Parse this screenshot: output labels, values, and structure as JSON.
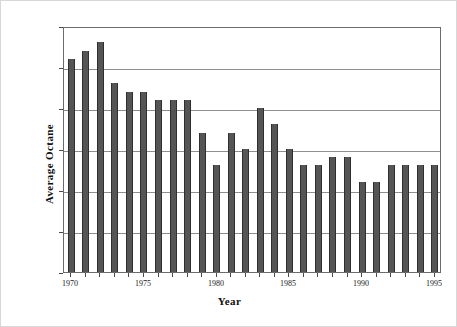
{
  "chart_data": {
    "type": "bar",
    "title": "",
    "xlabel": "Year",
    "ylabel": "Average Octane",
    "ylim": [
      87.5,
      90.5
    ],
    "ytick_labels": [
      "87.5",
      "88.0",
      "88.5",
      "89.0",
      "89.5",
      "90.0",
      "90.5"
    ],
    "ytick_values": [
      87.5,
      88.0,
      88.5,
      89.0,
      89.5,
      90.0,
      90.5
    ],
    "xtick_labels": [
      "1970",
      "1975",
      "1980",
      "1985",
      "1990",
      "1995"
    ],
    "xtick_values": [
      1970,
      1975,
      1980,
      1985,
      1990,
      1995
    ],
    "grid": "horizontal",
    "legend": "none",
    "bar_color": "#555555",
    "bar_edge_color": "#2f2f2f",
    "gridline_color": "#8f8f8f",
    "frame_color": "#6b6b6b",
    "categories": [
      1970,
      1971,
      1972,
      1973,
      1974,
      1975,
      1976,
      1977,
      1978,
      1979,
      1980,
      1981,
      1982,
      1983,
      1984,
      1985,
      1986,
      1987,
      1988,
      1989,
      1990,
      1991,
      1992,
      1993,
      1994,
      1995
    ],
    "values": [
      90.1,
      90.2,
      90.3,
      89.8,
      89.7,
      89.7,
      89.6,
      89.6,
      89.6,
      89.2,
      88.8,
      89.2,
      89.0,
      89.5,
      89.3,
      89.0,
      88.8,
      88.8,
      88.9,
      88.9,
      88.6,
      88.6,
      88.8,
      88.8,
      88.8,
      88.8
    ]
  }
}
